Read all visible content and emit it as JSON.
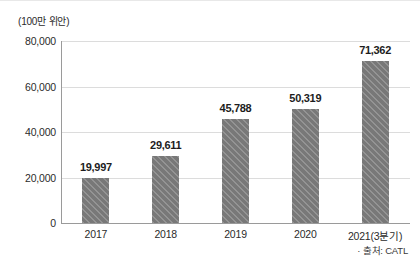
{
  "chart_data": {
    "type": "bar",
    "title": "",
    "unit_label": "(100만 위안)",
    "categories": [
      "2017",
      "2018",
      "2019",
      "2020",
      "2021(3분기)"
    ],
    "values": [
      19997,
      29611,
      45788,
      50319,
      71362
    ],
    "value_labels": [
      "19,997",
      "29,611",
      "45,788",
      "50,319",
      "71,362"
    ],
    "xlabel": "",
    "ylabel": "",
    "ylim": [
      0,
      80000
    ],
    "yticks": [
      0,
      20000,
      40000,
      60000,
      80000
    ],
    "ytick_labels": [
      "0",
      "20,000",
      "40,000",
      "60,000",
      "80,000"
    ],
    "grid": true,
    "legend": false,
    "series_color": "#7f7f7f",
    "gridline_color": "#dcdcdc",
    "axis_color": "#9a9a9a",
    "label_color": "#1d1d1d"
  },
  "source": {
    "text": "· 출처: CATL"
  }
}
